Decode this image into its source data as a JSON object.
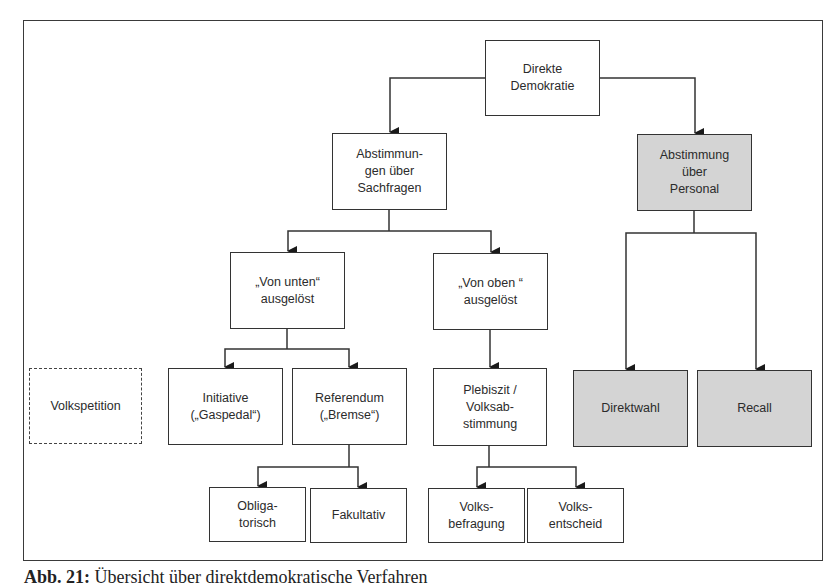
{
  "diagram": {
    "title": "Direkte Demokratie",
    "style": {
      "border_color": "#333333",
      "shaded_fill": "#d4d4d4",
      "plain_fill": "#ffffff"
    },
    "nodes": {
      "root": {
        "label": "Direkte\nDemokratie",
        "shaded": false
      },
      "sachfragen": {
        "label": "Abstimmun-\ngen über\nSachfragen",
        "shaded": false
      },
      "personal": {
        "label": "Abstimmung\nüber\nPersonal",
        "shaded": true
      },
      "von_unten": {
        "label": "„Von unten“\nausgelöst",
        "shaded": false
      },
      "von_oben": {
        "label": "„Von oben “\nausgelöst",
        "shaded": false
      },
      "volkspetition": {
        "label": "Volkspetition",
        "shaded": false,
        "dashed": true
      },
      "initiative": {
        "label": "Initiative\n(„Gaspedal“)",
        "shaded": false
      },
      "referendum": {
        "label": "Referendum\n(„Bremse“)",
        "shaded": false
      },
      "plebiszit": {
        "label": "Plebiszit /\nVolksab-\nstimmung",
        "shaded": false
      },
      "direktwahl": {
        "label": "Direktwahl",
        "shaded": true
      },
      "recall": {
        "label": "Recall",
        "shaded": true
      },
      "obligatorisch": {
        "label": "Obliga-\ntorisch",
        "shaded": false
      },
      "fakultativ": {
        "label": "Fakultativ",
        "shaded": false
      },
      "volksbefragung": {
        "label": "Volks-\nbefragung",
        "shaded": false
      },
      "volksentscheid": {
        "label": "Volks-\nentscheid",
        "shaded": false
      }
    },
    "edges": [
      [
        "root",
        "sachfragen"
      ],
      [
        "root",
        "personal"
      ],
      [
        "sachfragen",
        "von_unten"
      ],
      [
        "sachfragen",
        "von_oben"
      ],
      [
        "personal",
        "direktwahl"
      ],
      [
        "personal",
        "recall"
      ],
      [
        "von_unten",
        "initiative"
      ],
      [
        "von_unten",
        "referendum"
      ],
      [
        "von_oben",
        "plebiszit"
      ],
      [
        "referendum",
        "obligatorisch"
      ],
      [
        "referendum",
        "fakultativ"
      ],
      [
        "plebiszit",
        "volksbefragung"
      ],
      [
        "plebiszit",
        "volksentscheid"
      ]
    ]
  },
  "caption": {
    "label": "Abb. 21:",
    "text": "Übersicht über direktdemokratische Verfahren"
  }
}
